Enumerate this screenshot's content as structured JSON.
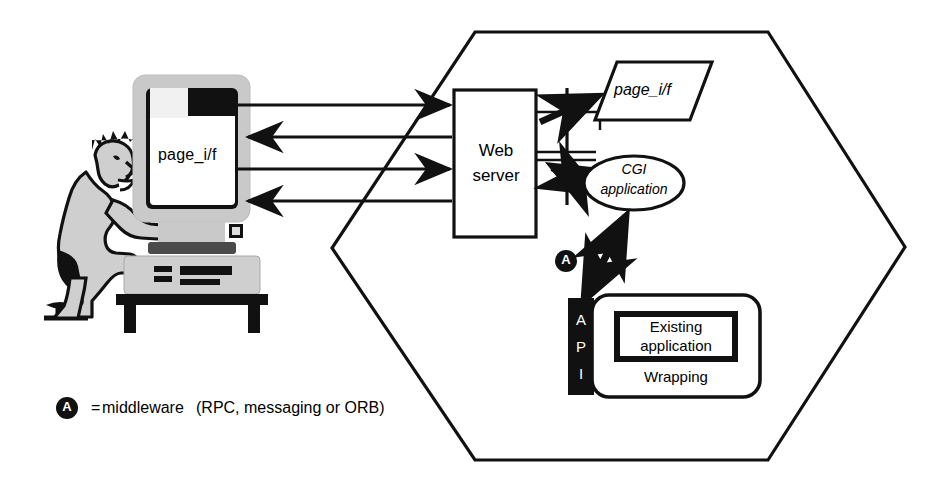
{
  "diagram": {
    "client": {
      "actor_name": "seated-user",
      "monitor_screen_label": "page_i/f",
      "monitor_body_color": "#bfbfbf",
      "monitor_screen_color": "#ffffff"
    },
    "server_zone": {
      "shape": "hexagon",
      "boundary_color": "#111111"
    },
    "nodes": [
      {
        "id": "web-server",
        "label": "Web server",
        "label_lines": [
          "Web",
          "server"
        ],
        "shape": "rectangle"
      },
      {
        "id": "page-if",
        "label": "page_i/f",
        "label_lines": [
          "page_i/f"
        ],
        "shape": "parallelogram",
        "italic": true
      },
      {
        "id": "cgi-application",
        "label": "CGI application",
        "label_lines": [
          "CGI",
          "application"
        ],
        "shape": "ellipse",
        "italic": true
      },
      {
        "id": "api-bar",
        "label": "API",
        "label_lines": [
          "A",
          "P",
          "I"
        ],
        "shape": "vertical-bar",
        "fill": "#000000",
        "text_color": "#ffffff"
      },
      {
        "id": "existing-application",
        "label": "Existing application",
        "label_lines": [
          "Existing",
          "application"
        ],
        "shape": "thick-rectangle"
      },
      {
        "id": "wrapping",
        "label": "Wrapping",
        "label_lines": [
          "Wrapping"
        ],
        "shape": "rounded-rectangle"
      }
    ],
    "connections": [
      {
        "id": "client-to-server-1",
        "from": "client",
        "to": "web-server",
        "direction": "right",
        "style": "thin"
      },
      {
        "id": "server-to-client-1",
        "from": "web-server",
        "to": "client",
        "direction": "left",
        "style": "thin"
      },
      {
        "id": "client-to-server-2",
        "from": "client",
        "to": "web-server",
        "direction": "right",
        "style": "thin"
      },
      {
        "id": "server-to-client-2",
        "from": "web-server",
        "to": "client",
        "direction": "left",
        "style": "thin"
      },
      {
        "id": "server-to-page-if",
        "from": "web-server",
        "to": "page-if",
        "direction": "right",
        "style": "thick"
      },
      {
        "id": "server-cgi-link",
        "from": "web-server",
        "to": "cgi-application",
        "direction": "both",
        "style": "thick"
      },
      {
        "id": "api-to-cgi",
        "from": "api-bar",
        "to": "cgi-application",
        "direction": "both",
        "style": "thick",
        "annotated_by": "middleware-marker"
      }
    ],
    "markers": [
      {
        "id": "middleware-marker-diagram",
        "glyph": "A",
        "shape": "filled-circle"
      }
    ],
    "legend": {
      "marker_glyph": "A",
      "equals": "=",
      "term": "middleware",
      "detail": "(RPC, messaging or ORB)"
    }
  }
}
